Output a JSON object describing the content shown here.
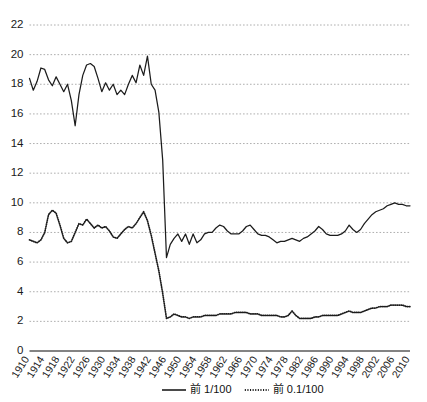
{
  "chart_data": {
    "type": "line",
    "title": "",
    "xlabel": "",
    "ylabel": "",
    "ylim": [
      0,
      22
    ],
    "ytick_step": 2,
    "yticks": [
      0,
      2,
      4,
      6,
      8,
      10,
      12,
      14,
      16,
      18,
      20,
      22
    ],
    "xlim": [
      1910,
      2010
    ],
    "xticks": [
      1910,
      1914,
      1918,
      1922,
      1926,
      1930,
      1934,
      1938,
      1942,
      1946,
      1950,
      1954,
      1958,
      1962,
      1966,
      1970,
      1974,
      1978,
      1982,
      1986,
      1990,
      1994,
      1998,
      2002,
      2006,
      2010
    ],
    "xtick_labels": [
      "1910",
      "1914",
      "1918",
      "1922",
      "1926",
      "1930",
      "1934",
      "1938",
      "1942",
      "1946",
      "1950",
      "1954",
      "1958",
      "1962",
      "1966",
      "1970",
      "1974",
      "1978",
      "1982",
      "1986",
      "1990",
      "1994",
      "1998",
      "2002",
      "2006",
      "2010"
    ],
    "grid": true,
    "grid_axis": "y",
    "legend_position": "bottom",
    "x": [
      1910,
      1911,
      1912,
      1913,
      1914,
      1915,
      1916,
      1917,
      1918,
      1919,
      1920,
      1921,
      1922,
      1923,
      1924,
      1925,
      1926,
      1927,
      1928,
      1929,
      1930,
      1931,
      1932,
      1933,
      1934,
      1935,
      1936,
      1937,
      1938,
      1939,
      1940,
      1941,
      1942,
      1943,
      1944,
      1945,
      1946,
      1947,
      1948,
      1949,
      1950,
      1951,
      1952,
      1953,
      1954,
      1955,
      1956,
      1957,
      1958,
      1959,
      1960,
      1961,
      1962,
      1963,
      1964,
      1965,
      1966,
      1967,
      1968,
      1969,
      1970,
      1971,
      1972,
      1973,
      1974,
      1975,
      1976,
      1977,
      1978,
      1979,
      1980,
      1981,
      1982,
      1983,
      1984,
      1985,
      1986,
      1987,
      1988,
      1989,
      1990,
      1991,
      1992,
      1993,
      1994,
      1995,
      1996,
      1997,
      1998,
      1999,
      2000,
      2001,
      2002,
      2003,
      2004,
      2005,
      2006,
      2007,
      2008,
      2009,
      2010
    ],
    "series": [
      {
        "name": "前 1/100",
        "style": "solid",
        "color": "#1c1c1c",
        "values": [
          18.4,
          17.6,
          18.2,
          19.1,
          19.0,
          18.3,
          17.9,
          18.5,
          18.0,
          17.5,
          18.0,
          16.9,
          15.2,
          17.3,
          18.6,
          19.3,
          19.4,
          19.2,
          18.4,
          17.5,
          18.1,
          17.6,
          18.0,
          17.3,
          17.6,
          17.3,
          18.0,
          18.6,
          18.1,
          19.3,
          18.6,
          19.9,
          18.0,
          17.6,
          16.1,
          12.9,
          6.3,
          7.2,
          7.6,
          7.9,
          7.4,
          7.9,
          7.2,
          7.9,
          7.3,
          7.5,
          7.9,
          8.0,
          8.0,
          8.3,
          8.5,
          8.4,
          8.1,
          7.9,
          7.9,
          7.9,
          8.1,
          8.4,
          8.5,
          8.2,
          7.9,
          7.8,
          7.8,
          7.7,
          7.5,
          7.3,
          7.4,
          7.4,
          7.5,
          7.6,
          7.5,
          7.4,
          7.6,
          7.7,
          7.9,
          8.1,
          8.4,
          8.2,
          7.9,
          7.8,
          7.8,
          7.8,
          7.9,
          8.1,
          8.5,
          8.2,
          8.0,
          8.2,
          8.6,
          8.9,
          9.2,
          9.4,
          9.5,
          9.6,
          9.8,
          9.9,
          10.0,
          9.9,
          9.9,
          9.8,
          9.8
        ]
      },
      {
        "name": "前 0.1/100",
        "style": "dotted",
        "color": "#1c1c1c",
        "values": [
          7.5,
          7.4,
          7.3,
          7.5,
          8.0,
          9.2,
          9.5,
          9.3,
          8.5,
          7.6,
          7.3,
          7.4,
          8.0,
          8.6,
          8.5,
          8.9,
          8.6,
          8.3,
          8.5,
          8.3,
          8.4,
          8.1,
          7.7,
          7.6,
          7.9,
          8.2,
          8.4,
          8.3,
          8.6,
          9.0,
          9.4,
          8.8,
          7.8,
          6.6,
          5.4,
          3.9,
          2.2,
          2.3,
          2.5,
          2.4,
          2.3,
          2.3,
          2.2,
          2.3,
          2.3,
          2.3,
          2.4,
          2.4,
          2.4,
          2.4,
          2.5,
          2.5,
          2.5,
          2.5,
          2.6,
          2.6,
          2.6,
          2.6,
          2.5,
          2.5,
          2.5,
          2.4,
          2.4,
          2.4,
          2.4,
          2.4,
          2.3,
          2.3,
          2.4,
          2.7,
          2.4,
          2.2,
          2.2,
          2.2,
          2.2,
          2.3,
          2.3,
          2.4,
          2.4,
          2.4,
          2.4,
          2.4,
          2.5,
          2.6,
          2.7,
          2.6,
          2.6,
          2.6,
          2.7,
          2.8,
          2.9,
          2.9,
          3.0,
          3.0,
          3.0,
          3.1,
          3.1,
          3.1,
          3.1,
          3.0,
          3.0
        ]
      }
    ],
    "legend": [
      {
        "label": "前 1/100",
        "style": "solid"
      },
      {
        "label": "前 0.1/100",
        "style": "dotted"
      }
    ]
  }
}
